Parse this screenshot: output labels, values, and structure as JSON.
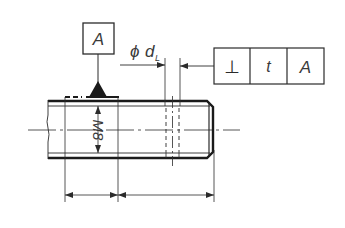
{
  "drawing": {
    "type": "technical-drawing",
    "subject": "threaded shaft with perpendicularity tolerance",
    "line_color": "#2b2b2b",
    "background": "#ffffff"
  },
  "datum": {
    "label": "A"
  },
  "thread": {
    "label": "M8"
  },
  "diameter_callout": {
    "symbol": "ϕ",
    "variable": "d",
    "subscript": "L"
  },
  "feature_control_frame": {
    "cells": [
      {
        "name": "perpendicularity-symbol",
        "text": "⊥"
      },
      {
        "name": "tolerance-value",
        "text": "t"
      },
      {
        "name": "datum-reference",
        "text": "A"
      }
    ]
  }
}
